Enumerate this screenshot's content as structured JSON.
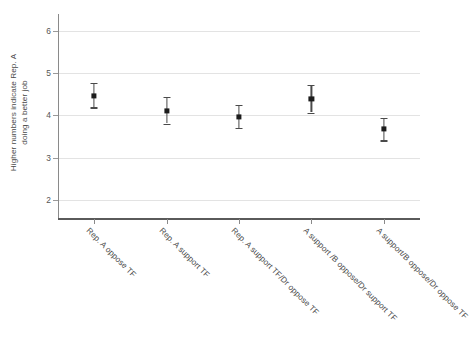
{
  "chart_data": {
    "type": "scatter",
    "title": "",
    "subtitle": "",
    "xlabel": "",
    "ylabel_line1": "Higher numbers indicate Rep. A",
    "ylabel_line2": "doing a better job",
    "ylim": [
      1.55,
      6.4
    ],
    "yticks": [
      2,
      3,
      4,
      5,
      6
    ],
    "ytick_labels": [
      "2",
      "3",
      "4",
      "5",
      "6"
    ],
    "grid": "horizontal",
    "legend": "none",
    "error_type": "95% confidence interval",
    "categories": [
      "Rep. A oppose TF",
      "Rep. A support TF",
      "Rep. A support TF/Dr oppose TF",
      "A support /B oppose/Dr support TF",
      "A support/B oppose/Dr oppose TF"
    ],
    "values": [
      4.47,
      4.11,
      3.97,
      4.4,
      3.68
    ],
    "err_low": [
      4.19,
      3.81,
      3.71,
      4.07,
      3.41
    ],
    "err_high": [
      4.77,
      4.44,
      4.26,
      4.73,
      3.94
    ],
    "marker_color": "#1c1c1c",
    "errorbar_color": "#4a4a4a",
    "gridline_color": "#e3e3e3",
    "axis_color": "#5a5a5a",
    "background_color": "#ffffff"
  }
}
